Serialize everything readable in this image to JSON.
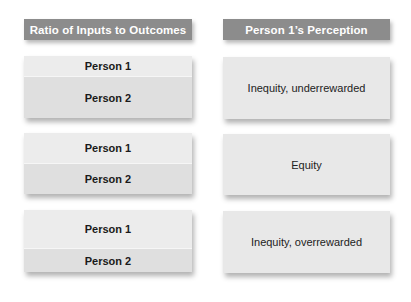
{
  "headers": {
    "left": "Ratio of Inputs to Outcomes",
    "right": "Person 1’s Perception"
  },
  "rows": [
    {
      "person1": "Person 1",
      "person2": "Person 2",
      "perception": "Inequity, underrewarded"
    },
    {
      "person1": "Person 1",
      "person2": "Person 2",
      "perception": "Equity"
    },
    {
      "person1": "Person 1",
      "person2": "Person 2",
      "perception": "Inequity, overrewarded"
    }
  ],
  "colors": {
    "header_bg": "#8c8c8c",
    "header_text": "#ffffff",
    "person1_bg": "#ececec",
    "person2_bg": "#dfdfdf",
    "perception_bg": "#e8e8e8"
  }
}
